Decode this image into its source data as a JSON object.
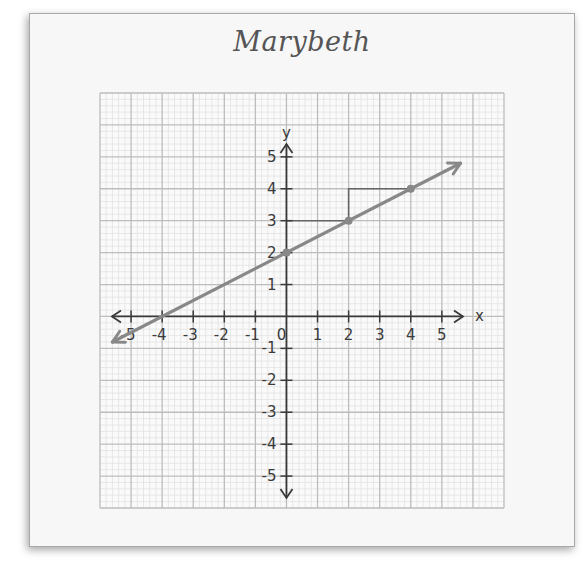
{
  "title": "Marybeth",
  "chart_data": {
    "type": "line",
    "title": "Marybeth",
    "xlabel": "x",
    "ylabel": "y",
    "xlim": [
      -6,
      7
    ],
    "ylim": [
      -6,
      7
    ],
    "grid": true,
    "x_ticks": [
      -5,
      -4,
      -3,
      -2,
      -1,
      0,
      1,
      2,
      3,
      4,
      5
    ],
    "y_ticks": [
      -5,
      -4,
      -3,
      -2,
      -1,
      1,
      2,
      3,
      4,
      5
    ],
    "x_tick_labels": [
      "-5",
      "-4",
      "-3",
      "-2",
      "-1",
      "0",
      "1",
      "2",
      "3",
      "4",
      "5"
    ],
    "y_tick_labels": [
      "-5",
      "-4",
      "-3",
      "-2",
      "-1",
      "1",
      "2",
      "3",
      "4",
      "5"
    ],
    "series": [
      {
        "name": "line",
        "equation": "y = 0.5x + 2",
        "slope": 0.5,
        "intercept": 2,
        "x_range": [
          -5.6,
          5.6
        ],
        "points": [
          [
            0,
            2
          ],
          [
            2,
            3
          ],
          [
            4,
            4
          ]
        ],
        "color": "#888888"
      }
    ],
    "annotations": [
      {
        "type": "slope-step",
        "path": [
          [
            0,
            3
          ],
          [
            2,
            3
          ]
        ]
      },
      {
        "type": "slope-step",
        "path": [
          [
            2,
            3
          ],
          [
            2,
            4
          ],
          [
            4,
            4
          ]
        ]
      }
    ]
  },
  "colors": {
    "card_bg": "#f7f7f7",
    "major_grid": "#bdbdbd",
    "minor_grid": "#e2e2e2",
    "axis": "#3a3a3a",
    "line": "#888888",
    "step": "#666666"
  }
}
